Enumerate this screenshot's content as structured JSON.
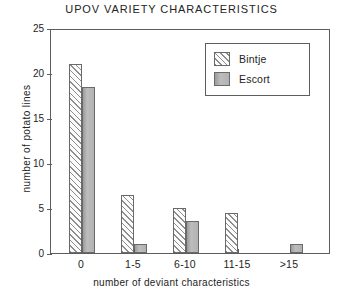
{
  "chart_data": {
    "type": "bar",
    "title": "UPOV VARIETY CHARACTERISTICS",
    "xlabel": "number of deviant characteristics",
    "ylabel": "number of potato lines",
    "categories": [
      "0",
      "1-5",
      "6-10",
      "11-15",
      ">15"
    ],
    "series": [
      {
        "name": "Bintje",
        "values": [
          21,
          6.5,
          5,
          4.5,
          0
        ],
        "fill": "diagonal-hatch"
      },
      {
        "name": "Escort",
        "values": [
          18.5,
          1,
          3.6,
          0,
          1
        ],
        "fill": "solid-gray"
      }
    ],
    "ylim": [
      0,
      25
    ],
    "yticks": [
      0,
      5,
      10,
      15,
      20,
      25
    ],
    "ytick_labels": [
      "0",
      "5",
      "10",
      "15",
      "20",
      "25"
    ],
    "grid": false,
    "legend_position": "top-right",
    "colors": {
      "bintje_hatch": "#8d8d8d",
      "escort_fill": "#b0b0b0",
      "axis": "#5d5d5d",
      "text": "#242424"
    }
  },
  "legend": {
    "entries": [
      {
        "label": "Bintje"
      },
      {
        "label": "Escort"
      }
    ]
  }
}
